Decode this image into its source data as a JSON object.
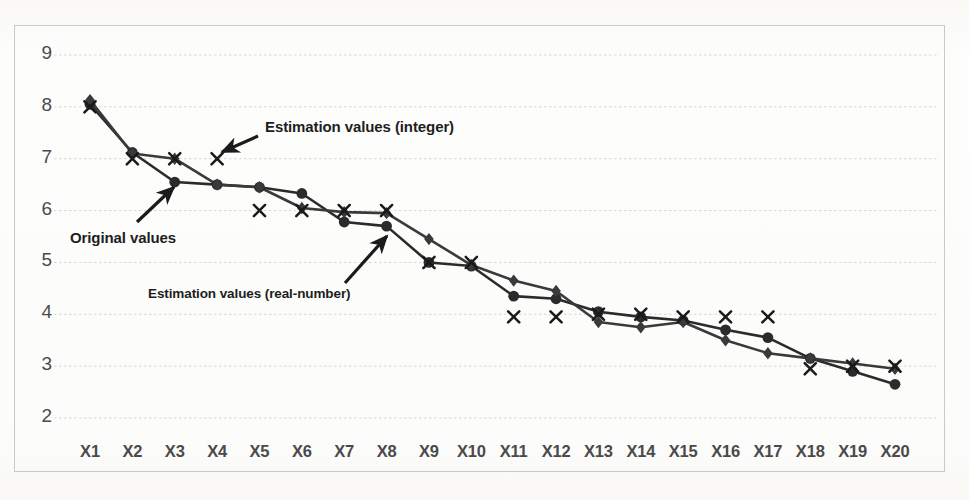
{
  "chart_data": {
    "type": "line",
    "title": "",
    "xlabel": "",
    "ylabel": "",
    "ylim": [
      2,
      9
    ],
    "yticks": [
      2,
      3,
      4,
      5,
      6,
      7,
      8,
      9
    ],
    "grid": true,
    "legend_position": "none",
    "categories": [
      "X1",
      "X2",
      "X3",
      "X4",
      "X5",
      "X6",
      "X7",
      "X8",
      "X9",
      "X10",
      "X11",
      "X12",
      "X13",
      "X14",
      "X15",
      "X16",
      "X17",
      "X18",
      "X19",
      "X20"
    ],
    "series": [
      {
        "name": "Original values",
        "marker": "circle",
        "color": "#2b2b2b",
        "values": [
          8.05,
          7.12,
          6.55,
          6.5,
          6.45,
          6.33,
          5.78,
          5.7,
          5.0,
          4.93,
          4.35,
          4.3,
          4.05,
          3.95,
          3.88,
          3.7,
          3.55,
          3.15,
          2.9,
          2.65
        ]
      },
      {
        "name": "Estimation values (real-number)",
        "marker": "diamond",
        "color": "#3a3a3a",
        "values": [
          8.13,
          7.1,
          7.0,
          6.5,
          6.45,
          6.05,
          5.97,
          5.95,
          5.45,
          4.95,
          4.65,
          4.45,
          3.85,
          3.75,
          3.85,
          3.5,
          3.25,
          3.15,
          3.05,
          2.95
        ]
      },
      {
        "name": "Estimation values (integer)",
        "marker": "cross",
        "color": "#1a1a1a",
        "line": false,
        "values": [
          8.0,
          7.0,
          7.0,
          7.0,
          6.0,
          6.0,
          6.0,
          6.0,
          5.0,
          5.0,
          3.95,
          3.95,
          4.0,
          4.0,
          3.95,
          3.95,
          3.95,
          2.95,
          3.0,
          3.0
        ]
      }
    ],
    "annotations": [
      {
        "id": "estimation-integer",
        "text": "Estimation values (integer)",
        "text_x": 265,
        "text_y": 118,
        "arrow_from_x": 258,
        "arrow_from_y": 136,
        "arrow_to_x": 222,
        "arrow_to_y": 152
      },
      {
        "id": "original-values",
        "text": "Original values",
        "text_x": 70,
        "text_y": 229,
        "arrow_from_x": 137,
        "arrow_from_y": 222,
        "arrow_to_x": 174,
        "arrow_to_y": 187
      },
      {
        "id": "estimation-real-number",
        "text": "Estimation values (real-number)",
        "text_x": 148,
        "text_y": 286,
        "arrow_from_x": 345,
        "arrow_from_y": 283,
        "arrow_to_x": 387,
        "arrow_to_y": 236
      }
    ],
    "colors": {
      "grid": "#d6d6d6",
      "border": "#c9c9c7",
      "tick_text": "#4a4a4a",
      "annotation_text": "#1e1e1e",
      "background": "#fdfdfc"
    }
  }
}
